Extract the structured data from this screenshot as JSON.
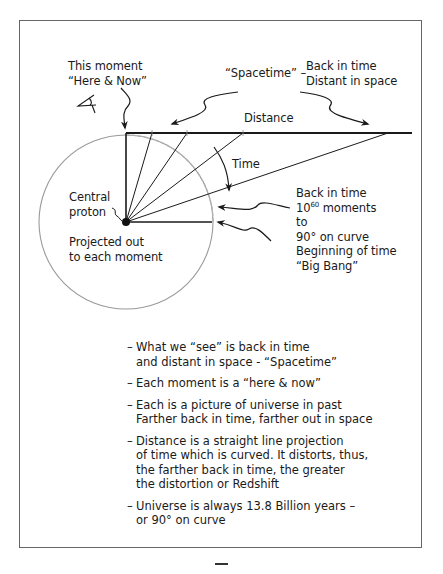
{
  "labels": {
    "this_moment": [
      "This moment",
      "“Here & Now”"
    ],
    "spacetime": "“Spacetime” –",
    "back_distant": [
      "Back in time",
      "Distant in space"
    ],
    "distance": "Distance",
    "time": "Time",
    "central_proton": [
      "Central",
      "proton"
    ],
    "projected": [
      "Projected out",
      "to each moment"
    ],
    "back_in_time": {
      "line1": "Back in time",
      "line2_base": "10",
      "line2_exp": "60",
      "line2_rest": " moments",
      "line3": "to",
      "line4": "90° on curve",
      "line5": "Beginning of time",
      "line6": "“Big Bang”"
    }
  },
  "notes": [
    {
      "lines": [
        "What we “see” is back in time",
        "and distant in space - “Spacetime”"
      ]
    },
    {
      "lines": [
        "Each moment is a “here & now”"
      ]
    },
    {
      "lines": [
        "Each is a picture of universe in past",
        "Farther back in time, farther out in space"
      ]
    },
    {
      "lines": [
        "Distance is a straight line projection",
        "of time which is curved. It distorts, thus,",
        "the farther back in time, the greater",
        "the distortion or Redshift"
      ]
    },
    {
      "lines": [
        "Universe is always 13.8 Billion years –",
        "or 90° on curve"
      ]
    }
  ],
  "icons": {
    "eye": "eye-icon"
  },
  "colors": {
    "line": "#1a1a1a",
    "circle": "#9a9a9a",
    "frame": "#666666"
  }
}
